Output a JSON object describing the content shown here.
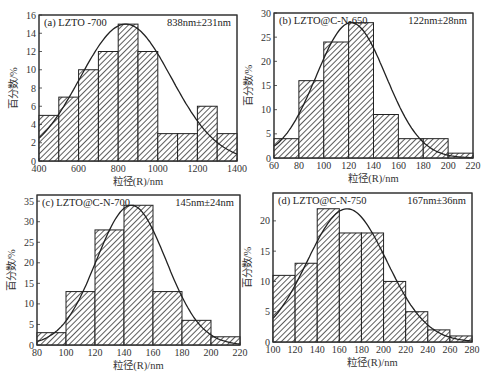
{
  "figure": {
    "xlabel": "粒径(R)/nm",
    "ylabel": "百分数/%"
  },
  "chart_data": [
    {
      "type": "bar",
      "id": "a",
      "title": "(a) LZTO -700",
      "annotation": "838nm±231nm",
      "xlabel": "粒径(R)/nm",
      "ylabel": "百分数/%",
      "bin_edges": [
        400,
        500,
        600,
        700,
        800,
        900,
        1000,
        1100,
        1200,
        1300,
        1400
      ],
      "values": [
        5,
        7,
        10,
        12,
        15,
        12,
        3,
        3,
        6,
        3
      ],
      "fit": {
        "type": "gaussian",
        "mean": 838,
        "sd": 231,
        "peak": 15
      },
      "xlim": [
        400,
        1400
      ],
      "ylim": [
        0,
        16
      ],
      "xticks": [
        400,
        600,
        800,
        1000,
        1200,
        1400
      ],
      "yticks": [
        0,
        2,
        4,
        6,
        8,
        10,
        12,
        14,
        16
      ],
      "box": {
        "x0": 39,
        "y0": 15,
        "x1": 237,
        "y1": 161
      }
    },
    {
      "type": "bar",
      "id": "b",
      "title": "(b) LZTO@C-N-650",
      "annotation": "122nm±28nm",
      "xlabel": "粒径(R)/nm",
      "ylabel": "百分数/%",
      "bin_edges": [
        60,
        80,
        100,
        120,
        140,
        160,
        180,
        200,
        220
      ],
      "values": [
        4,
        16,
        24,
        28,
        9,
        4,
        4,
        1
      ],
      "fit": {
        "type": "gaussian",
        "mean": 122,
        "sd": 28,
        "peak": 28
      },
      "xlim": [
        60,
        220
      ],
      "ylim": [
        0,
        30
      ],
      "xticks": [
        60,
        80,
        100,
        120,
        140,
        160,
        180,
        200,
        220
      ],
      "yticks": [
        0,
        5,
        10,
        15,
        20,
        25,
        30
      ],
      "box": {
        "x0": 274,
        "y0": 13,
        "x1": 473,
        "y1": 158
      }
    },
    {
      "type": "bar",
      "id": "c",
      "title": "(c) LZTO@C-N-700",
      "annotation": "145nm±24nm",
      "xlabel": "粒径(R)/nm",
      "ylabel": "百分数/%",
      "bin_edges": [
        80,
        100,
        120,
        140,
        160,
        180,
        200,
        220
      ],
      "values": [
        3,
        13,
        28,
        34,
        13,
        6,
        2
      ],
      "fit": {
        "type": "gaussian",
        "mean": 145,
        "sd": 24,
        "peak": 34
      },
      "xlim": [
        80,
        220
      ],
      "ylim": [
        0,
        36.5
      ],
      "xticks": [
        80,
        100,
        120,
        140,
        160,
        180,
        200,
        220
      ],
      "yticks": [
        0,
        5,
        10,
        15,
        20,
        25,
        30,
        35
      ],
      "box": {
        "x0": 37,
        "y0": 195,
        "x1": 240,
        "y1": 345
      }
    },
    {
      "type": "bar",
      "id": "d",
      "title": "(d) LZTO@C-N-750",
      "annotation": "167nm±36nm",
      "xlabel": "粒径(R)/nm",
      "ylabel": "百分数/%",
      "bin_edges": [
        100,
        120,
        140,
        160,
        180,
        200,
        220,
        240,
        260,
        280
      ],
      "values": [
        11,
        13,
        22,
        18,
        18,
        10,
        5,
        2,
        1
      ],
      "fit": {
        "type": "gaussian",
        "mean": 167,
        "sd": 36,
        "peak": 22
      },
      "xlim": [
        100,
        280
      ],
      "ylim": [
        0,
        24.6
      ],
      "xticks": [
        100,
        120,
        140,
        160,
        180,
        200,
        220,
        240,
        260,
        280
      ],
      "yticks": [
        0,
        5,
        10,
        15,
        20
      ],
      "box": {
        "x0": 273,
        "y0": 193,
        "x1": 472,
        "y1": 342
      }
    }
  ]
}
